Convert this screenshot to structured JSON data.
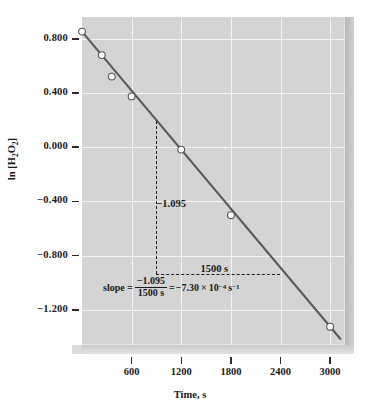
{
  "chart_data": {
    "type": "line",
    "title": "",
    "xlabel": "Time, s",
    "ylabel": "ln [H2O2]",
    "ylabel_html": "ln [H<sub>2</sub>O<sub>2</sub>]",
    "xlim": [
      0,
      3180
    ],
    "ylim": [
      -1.46,
      0.96
    ],
    "grid": true,
    "legend": null,
    "background": "#d4d4d4",
    "gridcolor": "#f4f4f4",
    "linecolor": "#5a5a5a",
    "markerface": "#ffffff",
    "markeredge": "#555555",
    "xticks": [
      600,
      1200,
      1800,
      2400,
      3000
    ],
    "xtick_labels": [
      "600",
      "1200",
      "1800",
      "2400",
      "3000"
    ],
    "yticks": [
      0.8,
      0.4,
      0.0,
      -0.4,
      -0.8,
      -1.2
    ],
    "ytick_labels": [
      "0.800",
      "0.400",
      "0.000",
      "-0.400",
      "-0.800",
      "-1.200"
    ],
    "series": [
      {
        "name": "ln [H2O2] vs time",
        "x": [
          0,
          240,
          360,
          600,
          1200,
          1800,
          3000
        ],
        "y": [
          0.852,
          0.679,
          0.52,
          0.374,
          -0.018,
          -0.502,
          -1.325
        ]
      }
    ],
    "annotations": [
      {
        "name": "rise-label",
        "text": "-1.095",
        "x": 900,
        "y": -0.425
      },
      {
        "name": "run-label",
        "text": "1500 s",
        "x": 1600,
        "y": -0.905
      },
      {
        "name": "dashed-vertical",
        "x": 900,
        "y_from": 0.195,
        "y_to": -0.935
      },
      {
        "name": "dashed-horizontal",
        "y": -0.935,
        "x_from": 900,
        "x_to": 2400
      }
    ],
    "slope_annotation": {
      "label": "slope =",
      "numerator": "-1.095",
      "denominator": "1500 s",
      "equals": "=",
      "result_mantissa": "-7.30",
      "result_times": "×",
      "result_base": "10",
      "result_exp": "-4",
      "result_unit": "s",
      "result_unit_exp": "-1",
      "full_text": "slope = -1.095 / 1500 s = -7.30 × 10^-4 s^-1"
    }
  }
}
